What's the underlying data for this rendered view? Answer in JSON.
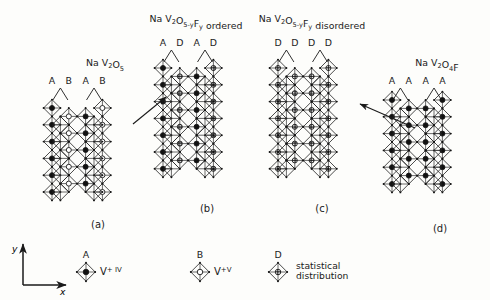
{
  "figure": {
    "axes": {
      "x_label": "x",
      "y_label": "y"
    },
    "panels": [
      {
        "id": "a",
        "caption": "(a)",
        "formula_plain": "Na V2O5",
        "formula_parts": [
          {
            "t": "Na ",
            "k": "n"
          },
          {
            "t": "V",
            "k": "n"
          },
          {
            "t": "2",
            "k": "sub"
          },
          {
            "t": "O",
            "k": "n"
          },
          {
            "t": "5",
            "k": "sub"
          }
        ],
        "site_labels": [
          "A",
          "B",
          "A",
          "B"
        ],
        "site_types": [
          "A",
          "B",
          "A",
          "B"
        ],
        "description": "alternating filled and open vanadium sites"
      },
      {
        "id": "b",
        "caption": "(b)",
        "formula_plain": "Na V2O5-yFy ordered",
        "formula_parts": [
          {
            "t": "Na ",
            "k": "n"
          },
          {
            "t": "V",
            "k": "n"
          },
          {
            "t": "2",
            "k": "sub"
          },
          {
            "t": "O",
            "k": "n"
          },
          {
            "t": "5-y",
            "k": "sub"
          },
          {
            "t": "F",
            "k": "n"
          },
          {
            "t": "y",
            "k": "sub"
          },
          {
            "t": "  ordered",
            "k": "n"
          }
        ],
        "site_labels": [
          "A",
          "D",
          "A",
          "D"
        ],
        "site_types": [
          "A",
          "D",
          "A",
          "D"
        ],
        "description": "alternating filled and statistical sites"
      },
      {
        "id": "c",
        "caption": "(c)",
        "formula_plain": "Na V2O5-yFy disordered",
        "formula_parts": [
          {
            "t": "Na ",
            "k": "n"
          },
          {
            "t": "V",
            "k": "n"
          },
          {
            "t": "2",
            "k": "sub"
          },
          {
            "t": "O",
            "k": "n"
          },
          {
            "t": "5-y",
            "k": "sub"
          },
          {
            "t": "F",
            "k": "n"
          },
          {
            "t": "y",
            "k": "sub"
          },
          {
            "t": "  disordered",
            "k": "n"
          }
        ],
        "site_labels": [
          "D",
          "D",
          "D",
          "D"
        ],
        "site_types": [
          "D",
          "D",
          "D",
          "D"
        ],
        "description": "all statistical distribution sites"
      },
      {
        "id": "d",
        "caption": "(d)",
        "formula_plain": "Na V2O4F",
        "formula_parts": [
          {
            "t": "Na ",
            "k": "n"
          },
          {
            "t": "V",
            "k": "n"
          },
          {
            "t": "2",
            "k": "sub"
          },
          {
            "t": "O",
            "k": "n"
          },
          {
            "t": "4",
            "k": "sub"
          },
          {
            "t": "F",
            "k": "n"
          }
        ],
        "site_labels": [
          "A",
          "A",
          "A",
          "A"
        ],
        "site_types": [
          "A",
          "A",
          "A",
          "A"
        ],
        "description": "all filled vanadium sites"
      }
    ],
    "arrows": [
      {
        "from": "a",
        "to": "b",
        "direction": "up-right"
      },
      {
        "from": "d",
        "to": "c",
        "direction": "up-left"
      }
    ],
    "legend": [
      {
        "key": "A",
        "symbol": "filled-circle-in-diamond",
        "label_parts": [
          {
            "t": "V",
            "k": "n"
          },
          {
            "t": "+ IV",
            "k": "sup"
          }
        ],
        "label_plain": "V+IV"
      },
      {
        "key": "B",
        "symbol": "open-circle-in-diamond",
        "label_parts": [
          {
            "t": "V",
            "k": "n"
          },
          {
            "t": "+V",
            "k": "sup"
          }
        ],
        "label_plain": "V+V"
      },
      {
        "key": "D",
        "symbol": "crossed-circle-in-diamond",
        "label_parts": [
          {
            "t": "statistical",
            "k": "n"
          },
          {
            "t": "distribution",
            "k": "n"
          }
        ],
        "label_plain": "statistical distribution"
      }
    ],
    "colors": {
      "ink": "#1a1a1a",
      "line": "#2b2b2b",
      "fill_filled": "#111111",
      "fill_open": "#ffffff",
      "background": "#fdfdfb"
    }
  }
}
